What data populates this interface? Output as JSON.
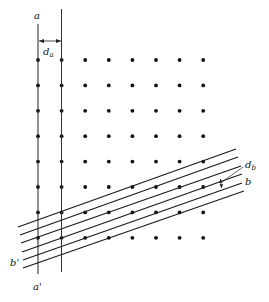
{
  "figure": {
    "type": "lattice-planes-diagram",
    "lattice": {
      "columns": 8,
      "rows": 8
    },
    "plane_family_a": {
      "label_top": "a",
      "label_bottom": "a'",
      "spacing_label": "d",
      "spacing_subscript": "a",
      "line_count": 2
    },
    "plane_family_b": {
      "label_right": "b",
      "label_left": "b'",
      "spacing_label": "d",
      "spacing_subscript": "b",
      "line_count": 6
    },
    "colors": {
      "ink": "#111111",
      "background": "#ffffff"
    }
  }
}
